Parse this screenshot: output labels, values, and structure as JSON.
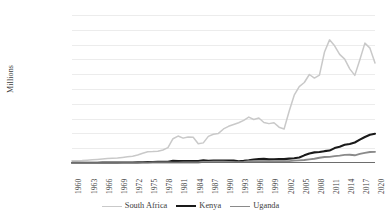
{
  "chart_data": {
    "type": "line",
    "title": "",
    "xlabel": "",
    "ylabel": "Millions",
    "ylim": [
      0,
      500000
    ],
    "grid": true,
    "legend_position": "bottom",
    "x": [
      1960,
      1961,
      1962,
      1963,
      1964,
      1965,
      1966,
      1967,
      1968,
      1969,
      1970,
      1971,
      1972,
      1973,
      1974,
      1975,
      1976,
      1977,
      1978,
      1979,
      1980,
      1981,
      1982,
      1983,
      1984,
      1985,
      1986,
      1987,
      1988,
      1989,
      1990,
      1991,
      1992,
      1993,
      1994,
      1995,
      1996,
      1997,
      1998,
      1999,
      2000,
      2001,
      2002,
      2003,
      2004,
      2005,
      2006,
      2007,
      2008,
      2009,
      2010,
      2011,
      2012,
      2013,
      2014,
      2015,
      2016,
      2017,
      2018,
      2019,
      2020
    ],
    "x_tick_labels": [
      "1960",
      "1963",
      "1966",
      "1969",
      "1972",
      "1975",
      "1978",
      "1981",
      "1984",
      "1987",
      "1990",
      "1993",
      "1996",
      "1999",
      "2002",
      "2005",
      "2008",
      "2011",
      "2014",
      "2017",
      "2020"
    ],
    "y_tick_labels": [
      "500 000",
      "450 000",
      "400 000",
      "350 000",
      "300 000",
      "250 000",
      "200 000",
      "150 000",
      "100 000",
      "50 000",
      "0"
    ],
    "y_tick_values": [
      500000,
      450000,
      400000,
      350000,
      300000,
      250000,
      200000,
      150000,
      100000,
      50000,
      0
    ],
    "series": [
      {
        "name": "South Africa",
        "color": "#c9c9c9",
        "width": 1.5,
        "values": [
          7575,
          8000,
          8500,
          9500,
          10800,
          12000,
          13200,
          14800,
          15800,
          17200,
          19000,
          21000,
          23000,
          27000,
          33000,
          38000,
          38500,
          40000,
          44000,
          52000,
          82000,
          91000,
          84000,
          88000,
          87000,
          65000,
          68000,
          90000,
          97000,
          100000,
          115000,
          124000,
          130000,
          136000,
          144000,
          155000,
          147000,
          152000,
          137000,
          133000,
          136000,
          121000,
          115000,
          175000,
          229000,
          258000,
          272000,
          299000,
          287000,
          297000,
          375000,
          416000,
          396000,
          367000,
          351000,
          318000,
          296000,
          349000,
          405000,
          388000,
          338000
        ]
      },
      {
        "name": "Kenya",
        "color": "#1a1a1a",
        "width": 2.1,
        "values": [
          790,
          800,
          850,
          900,
          980,
          1000,
          1150,
          1200,
          1300,
          1400,
          1600,
          1750,
          1900,
          2200,
          2600,
          2900,
          3200,
          4100,
          4300,
          4400,
          7200,
          7000,
          6600,
          6400,
          6200,
          6800,
          8900,
          7200,
          8100,
          8600,
          8500,
          8200,
          8100,
          5750,
          7150,
          9050,
          12000,
          13100,
          14100,
          12900,
          12700,
          13000,
          13100,
          14900,
          16100,
          18700,
          25800,
          31960,
          35900,
          37000,
          40000,
          41950,
          50400,
          55100,
          61400,
          64000,
          69200,
          78800,
          87900,
          95500,
          98800
        ]
      },
      {
        "name": "Uganda",
        "color": "#8a8a8a",
        "width": 1.9,
        "values": [
          420,
          430,
          450,
          470,
          500,
          520,
          560,
          600,
          640,
          700,
          800,
          900,
          1000,
          1100,
          1200,
          1400,
          1500,
          1800,
          2000,
          1600,
          1250,
          1300,
          1450,
          1480,
          1500,
          1520,
          3900,
          3700,
          4300,
          4500,
          4300,
          3300,
          2900,
          3000,
          3800,
          5750,
          6000,
          6300,
          6500,
          6600,
          6200,
          5700,
          6100,
          6300,
          7900,
          9000,
          10000,
          12300,
          14200,
          17900,
          20180,
          20640,
          23120,
          24960,
          27520,
          27830,
          25970,
          30760,
          34400,
          37200,
          37600
        ]
      }
    ]
  },
  "legend": {
    "items": [
      {
        "label": "South Africa"
      },
      {
        "label": "Kenya"
      },
      {
        "label": "Uganda"
      }
    ]
  }
}
